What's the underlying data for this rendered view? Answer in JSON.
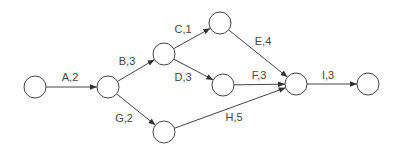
{
  "diagram": {
    "type": "activity-on-arrow network",
    "nodes": [
      {
        "id": "n1",
        "x": 35,
        "y": 87
      },
      {
        "id": "n2",
        "x": 108,
        "y": 87
      },
      {
        "id": "n3",
        "x": 164,
        "y": 54
      },
      {
        "id": "n4",
        "x": 164,
        "y": 132
      },
      {
        "id": "n5",
        "x": 220,
        "y": 23
      },
      {
        "id": "n6",
        "x": 223,
        "y": 85
      },
      {
        "id": "n7",
        "x": 296,
        "y": 84
      },
      {
        "id": "n8",
        "x": 368,
        "y": 84
      }
    ],
    "activities": [
      {
        "label": "A,2",
        "from": "n1",
        "to": "n2",
        "lx": 70,
        "ly": 77
      },
      {
        "label": "B,3",
        "from": "n2",
        "to": "n3",
        "lx": 127,
        "ly": 61
      },
      {
        "label": "C,1",
        "from": "n3",
        "to": "n5",
        "lx": 183,
        "ly": 29
      },
      {
        "label": "D,3",
        "from": "n3",
        "to": "n6",
        "lx": 183,
        "ly": 77
      },
      {
        "label": "G,2",
        "from": "n2",
        "to": "n4",
        "lx": 124,
        "ly": 118
      },
      {
        "label": "E,4",
        "from": "n5",
        "to": "n7",
        "lx": 263,
        "ly": 41
      },
      {
        "label": "F,3",
        "from": "n6",
        "to": "n7",
        "lx": 259,
        "ly": 75
      },
      {
        "label": "H,5",
        "from": "n4",
        "to": "n7",
        "lx": 234,
        "ly": 117
      },
      {
        "label": "I,3",
        "from": "n7",
        "to": "n8",
        "lx": 328,
        "ly": 75
      }
    ],
    "node_radius": 11,
    "stroke_color": "#444444"
  }
}
